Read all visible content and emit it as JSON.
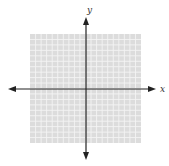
{
  "figure": {
    "type": "coordinate-plane",
    "width": 169,
    "height": 166,
    "grid": {
      "left": 30,
      "top": 34,
      "right": 141,
      "bottom": 143,
      "cells_x": 20,
      "cells_y": 20,
      "fill_color": "#dcdcdc",
      "line_color": "#f4f4f4"
    },
    "origin": {
      "x": 86,
      "y": 89
    },
    "axes": {
      "color": "#222222",
      "x": {
        "label": "x",
        "from": 8,
        "to": 156
      },
      "y": {
        "label": "y",
        "from": 17,
        "to": 160
      }
    }
  }
}
